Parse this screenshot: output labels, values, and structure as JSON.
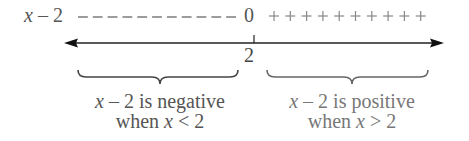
{
  "expression": {
    "var": "x",
    "op": " – ",
    "const": "2"
  },
  "sign_row": {
    "negative_symbol": "–",
    "negative_count": 11,
    "zero_label": "0",
    "positive_symbol": "+",
    "positive_count": 10
  },
  "number_line": {
    "tick_label": "2",
    "arrows": "both"
  },
  "captions": {
    "left": {
      "line1_var": "x",
      "line1_rest": " – 2 is negative",
      "line2_pre": "when ",
      "line2_var": "x",
      "line2_rest": " < 2"
    },
    "right": {
      "line1_var": "x",
      "line1_rest": " – 2 is positive",
      "line2_pre": "when ",
      "line2_var": "x",
      "line2_rest": " > 2"
    }
  },
  "colors": {
    "line": "#222222",
    "text_dark": "#555555",
    "text_light": "#777777",
    "dash": "#666666",
    "plus": "#888888"
  }
}
